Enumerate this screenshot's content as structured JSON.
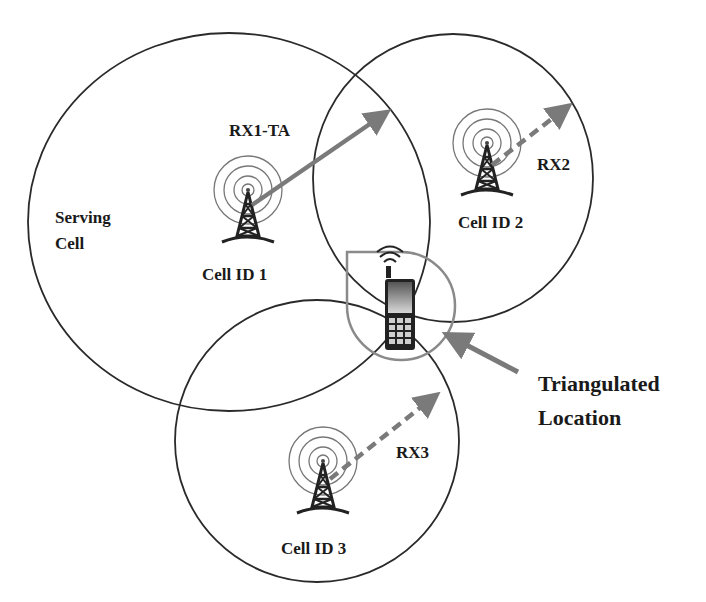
{
  "diagram": {
    "type": "cell-tower-triangulation",
    "colors": {
      "background": "#ffffff",
      "circle_stroke": "#2a2a2a",
      "arrow_gray": "#7a7a7a",
      "location_region": "#8a8a8a",
      "text": "#1a1a1a"
    },
    "labels": {
      "serving_cell_line1": "Serving",
      "serving_cell_line2": "Cell",
      "rx1": "RX1-TA",
      "rx2": "RX2",
      "rx3": "RX3",
      "cell1": "Cell ID 1",
      "cell2": "Cell ID 2",
      "cell3": "Cell ID 3",
      "triangulated_line1": "Triangulated",
      "triangulated_line2": "Location"
    },
    "cells": [
      {
        "id": "Cell ID 1",
        "role": "Serving Cell",
        "measurement": "RX1-TA",
        "arrow_style": "solid"
      },
      {
        "id": "Cell ID 2",
        "measurement": "RX2",
        "arrow_style": "dashed"
      },
      {
        "id": "Cell ID 3",
        "measurement": "RX3",
        "arrow_style": "dashed"
      }
    ],
    "icons": [
      "cell-tower-icon",
      "mobile-phone-icon",
      "signal-waves-icon"
    ]
  }
}
